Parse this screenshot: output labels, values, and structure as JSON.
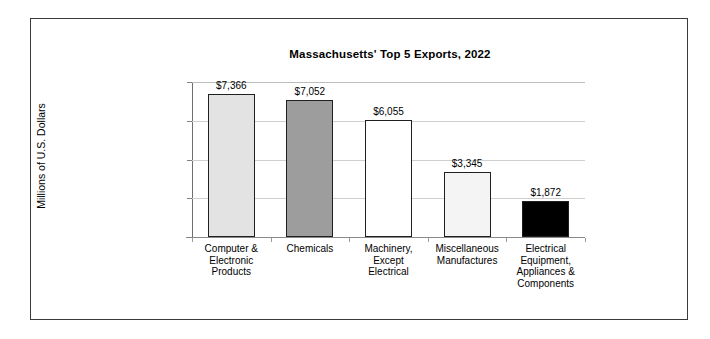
{
  "chart_data": {
    "type": "bar",
    "title": "Massachusetts' Top 5 Exports, 2022",
    "xlabel": "",
    "ylabel": "Millions of U.S. Dollars",
    "ylim": [
      0,
      8000
    ],
    "grid": true,
    "legend": "none",
    "categories": [
      "Computer & Electronic Products",
      "Chemicals",
      "Machinery, Except Electrical",
      "Miscellaneous Manufactures",
      "Electrical Equipment, Appliances & Components"
    ],
    "values": [
      7366,
      7052,
      6055,
      3345,
      1872
    ],
    "value_labels": [
      "$7,366",
      "$7,052",
      "$6,055",
      "$3,345",
      "$1,872"
    ],
    "bar_colors": [
      "#e3e3e3",
      "#9d9d9d",
      "#ffffff",
      "#f4f4f4",
      "#000000"
    ],
    "bar_border_color": "#1f1f1f",
    "y_ticks": [
      0,
      2000,
      4000,
      6000,
      8000
    ],
    "y_tick_labels": [
      "$0",
      "$2,000",
      "$4,000",
      "$6,000",
      "$8,000"
    ],
    "gridline_color": "#cfcfcf",
    "axis_color": "#808080",
    "background_color": "#ffffff",
    "frame_color": "#3a3a3a"
  },
  "categories_display": [
    [
      "Computer &",
      "Electronic",
      "Products"
    ],
    [
      "Chemicals"
    ],
    [
      "Machinery,",
      "Except",
      "Electrical"
    ],
    [
      "Miscellaneous",
      "Manufactures"
    ],
    [
      "Electrical",
      "Equipment,",
      "Appliances &",
      "Components"
    ]
  ]
}
